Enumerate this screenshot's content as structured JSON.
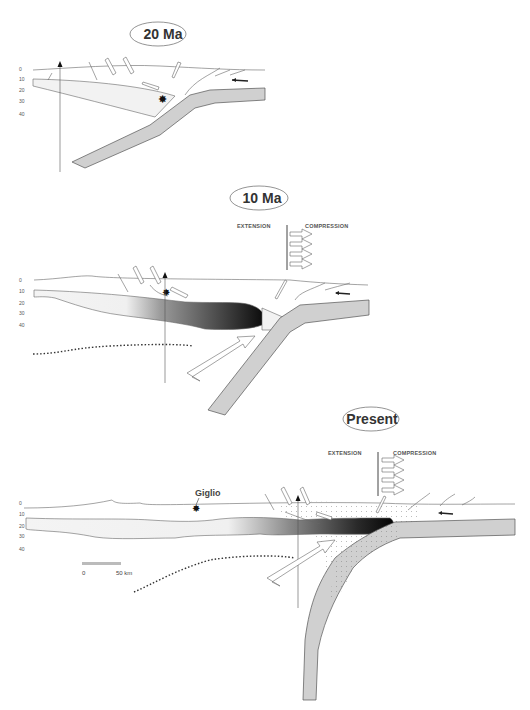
{
  "figure": {
    "type": "geological cross-section sequence",
    "panels": [
      {
        "id": "20ma",
        "title": "20 Ma",
        "depth_ticks": [
          "0",
          "10",
          "20",
          "30",
          "40"
        ],
        "features": [
          "subducting slab",
          "lower crust wedge",
          "normal faults",
          "thrust faults",
          "magmatism star",
          "vertical reference arrow",
          "left-pointing thrust arrow"
        ]
      },
      {
        "id": "10ma",
        "title": "10 Ma",
        "depth_ticks": [
          "0",
          "10",
          "20",
          "30",
          "40"
        ],
        "extension_label": "EXTENSION",
        "compression_label": "COMPRESSION",
        "compression_arrows": 4,
        "features": [
          "subducting slab",
          "melt body gradient",
          "asthenospheric flow arrow",
          "dotted lithosphere-asthenosphere boundary",
          "magmatism star",
          "vertical reference arrow"
        ]
      },
      {
        "id": "present",
        "title": "Present",
        "depth_ticks": [
          "0",
          "10",
          "20",
          "30",
          "40"
        ],
        "extension_label": "EXTENSION",
        "compression_label": "COMPRESSION",
        "compression_arrows": 4,
        "place_label": "Giglio",
        "scale_bar": {
          "start": "0",
          "end": "50 km"
        },
        "features": [
          "steepened subducting slab",
          "melt body gradient",
          "stippled accretionary zone",
          "asthenospheric flow arrow",
          "dotted lithosphere-asthenosphere boundary",
          "Giglio star",
          "vertical reference arrow"
        ]
      }
    ],
    "colors": {
      "slab": "#d0d0d0",
      "lines": "#666666",
      "melt_dark": "#111111",
      "crust_light": "#f2f2f2"
    }
  }
}
